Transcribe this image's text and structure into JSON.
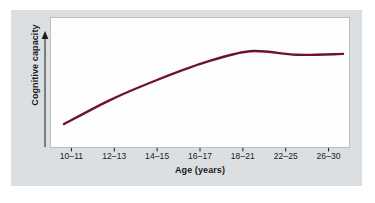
{
  "figure": {
    "panel_background": "#dcdfe2",
    "plot_background": "#fdfdfd",
    "curve_color": "#6e1139",
    "axis_color": "#1b1b1b"
  },
  "ghost_text": {
    "top": "",
    "bottom": ""
  },
  "chart_data": {
    "type": "line",
    "title": "",
    "xlabel": "Age (years)",
    "ylabel": "Cognitive capacity",
    "categories": [
      "10–11",
      "12–13",
      "14–15",
      "16–17",
      "18–21",
      "22–25",
      "26–30"
    ],
    "series": [
      {
        "name": "Cognitive capacity",
        "color": "#6e1139",
        "values": [
          11,
          38,
          60,
          79,
          92,
          88,
          89
        ]
      }
    ],
    "ylim": [
      0,
      100
    ],
    "y_tick_labels": [],
    "grid": false,
    "legend": false,
    "y_axis_style": "arrow"
  }
}
